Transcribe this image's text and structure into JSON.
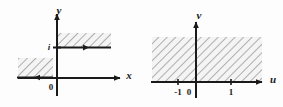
{
  "figure": {
    "background_color": "#fdfdfd",
    "line_color": "#1a1a1a",
    "hatch_color": "#9a9a9a",
    "hatch_fill": "#f2f2f2"
  },
  "left_plot": {
    "name": "z-plane",
    "vertical_axis_label": "y",
    "horizontal_axis_label": "x",
    "origin_label": "0",
    "imaginary_unit_label": "i",
    "regions": [
      {
        "name": "upper-right-strip",
        "hatched": true,
        "boundary": "solid",
        "boundary_arrow": "right"
      },
      {
        "name": "lower-left-block",
        "hatched": true,
        "boundary": "solid",
        "boundary_arrow": "left"
      }
    ]
  },
  "right_plot": {
    "name": "w-plane",
    "vertical_axis_label": "v",
    "horizontal_axis_label": "u",
    "origin_label": "0",
    "tick_labels": [
      "-1",
      "0",
      "1"
    ],
    "regions": [
      {
        "name": "upper-half-band",
        "hatched": true,
        "boundary": "none"
      }
    ]
  }
}
